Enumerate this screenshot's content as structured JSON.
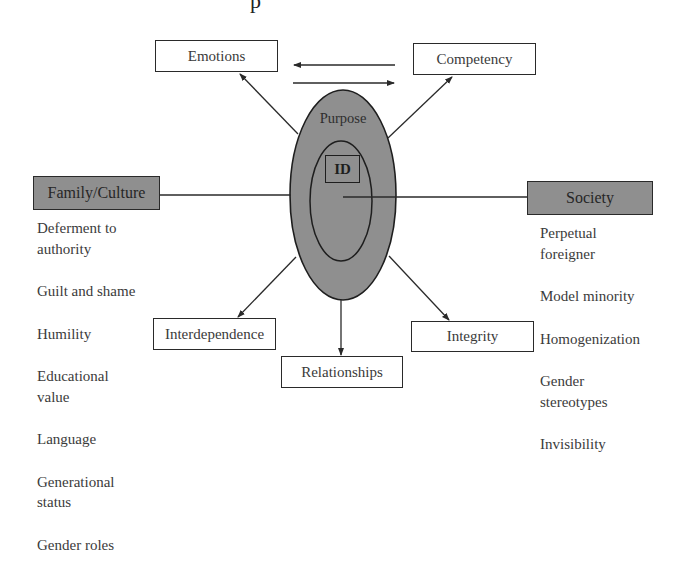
{
  "title_fragment": "p",
  "colors": {
    "ellipse_fill": "#8f8f8f",
    "box_border": "#2a2a2a",
    "filled_box": "#8f8f8f",
    "line": "#2a2a2a",
    "text": "#3a3a3a"
  },
  "center": {
    "outer_label": "Purpose",
    "inner_label": "ID"
  },
  "nodes": {
    "emotions": "Emotions",
    "competency": "Competency",
    "interdependence": "Interdependence",
    "relationships": "Relationships",
    "integrity": "Integrity"
  },
  "family_culture": {
    "heading": "Family/Culture",
    "items": [
      {
        "line1": "Deferment to",
        "line2": "authority"
      },
      {
        "line1": "Guilt and shame",
        "line2": ""
      },
      {
        "line1": "Humility",
        "line2": ""
      },
      {
        "line1": "Educational",
        "line2": "value"
      },
      {
        "line1": "Language",
        "line2": ""
      },
      {
        "line1": "Generational",
        "line2": "status"
      },
      {
        "line1": "Gender roles",
        "line2": ""
      }
    ]
  },
  "society": {
    "heading": "Society",
    "items": [
      {
        "line1": "Perpetual",
        "line2": "foreigner"
      },
      {
        "line1": "Model minority",
        "line2": ""
      },
      {
        "line1": "Homogenization",
        "line2": ""
      },
      {
        "line1": "Gender",
        "line2": "stereotypes"
      },
      {
        "line1": "Invisibility",
        "line2": ""
      }
    ]
  }
}
